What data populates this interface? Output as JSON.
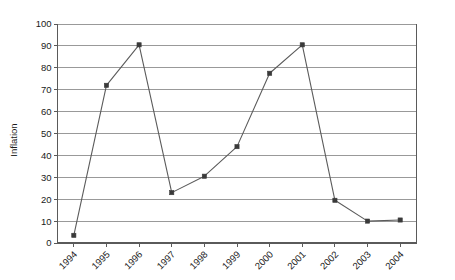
{
  "clipped_title": "",
  "chart_data": {
    "type": "line",
    "title": "",
    "xlabel": "",
    "ylabel": "Inflation",
    "categories": [
      "1994",
      "1995",
      "1996",
      "1997",
      "1998",
      "1999",
      "2000",
      "2001",
      "2002",
      "2003",
      "2004"
    ],
    "values": [
      3.5,
      72,
      90.5,
      23,
      30.5,
      44,
      77.5,
      90.5,
      19.5,
      10,
      10.5
    ],
    "series": [
      {
        "name": "Inflation",
        "values": [
          3.5,
          72,
          90.5,
          23,
          30.5,
          44,
          77.5,
          90.5,
          19.5,
          10,
          10.5
        ]
      }
    ],
    "ylim": [
      0,
      100
    ],
    "ytick_step": 10,
    "yticks": [
      0,
      10,
      20,
      30,
      40,
      50,
      60,
      70,
      80,
      90,
      100
    ],
    "ytick_labels": [
      "0",
      "10",
      "20",
      "30",
      "40",
      "50",
      "60",
      "70",
      "80",
      "90",
      "100"
    ],
    "grid": true,
    "grid_axis": "y",
    "legend": false,
    "legend_position": "none",
    "marker": "square",
    "xtick_label_rotation": -45,
    "line_color": "#5b5b5b",
    "marker_color": "#3a3a3a",
    "grid_color": "#8e8e8e",
    "axis_color": "#5a5a5a",
    "background_color": "#ffffff"
  }
}
